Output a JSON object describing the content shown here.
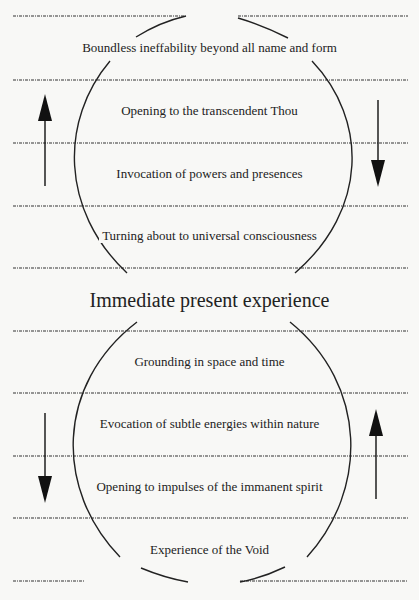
{
  "diagram": {
    "center_label": "Immediate present experience",
    "upper_levels": [
      "Boundless ineffability beyond all name and form",
      "Opening to the transcendent Thou",
      "Invocation of powers and presences",
      "Turning about to universal consciousness"
    ],
    "lower_levels": [
      "Grounding in space and time",
      "Evocation of subtle energies within nature",
      "Opening to impulses of the immanent spirit",
      "Experience of the Void"
    ],
    "arrows": {
      "upper_left": "up",
      "upper_right": "down",
      "lower_left": "down",
      "lower_right": "up"
    },
    "colors": {
      "line": "#222222",
      "background": "#f8f8f6"
    }
  }
}
